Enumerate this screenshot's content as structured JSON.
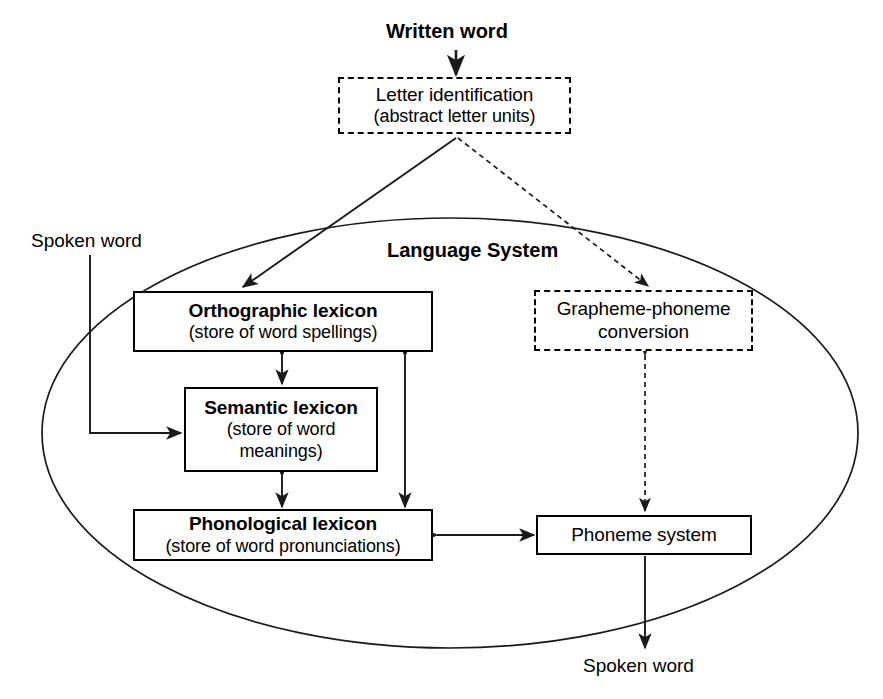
{
  "diagram": {
    "container_label": "Language System",
    "inputs": {
      "written_word": "Written word",
      "spoken_word_input": "Spoken word"
    },
    "outputs": {
      "spoken_word_output": "Spoken word"
    },
    "nodes": [
      {
        "id": "letter-identification",
        "title": "Letter identification",
        "subtitle": "(abstract letter units)",
        "style": "dashed",
        "bold_title": false
      },
      {
        "id": "orthographic-lexicon",
        "title": "Orthographic lexicon",
        "subtitle": "(store of word spellings)",
        "style": "solid",
        "bold_title": true
      },
      {
        "id": "semantic-lexicon",
        "title": "Semantic lexicon",
        "subtitle": "(store of word meanings)",
        "style": "solid",
        "bold_title": true
      },
      {
        "id": "phonological-lexicon",
        "title": "Phonological lexicon",
        "subtitle": "(store of word pronunciations)",
        "style": "solid",
        "bold_title": true
      },
      {
        "id": "grapheme-phoneme-conversion",
        "title": "Grapheme-phoneme conversion",
        "subtitle": "",
        "style": "dashed",
        "bold_title": false
      },
      {
        "id": "phoneme-system",
        "title": "Phoneme system",
        "subtitle": "",
        "style": "solid",
        "bold_title": false
      }
    ],
    "node_text": {
      "letter_identification_l1": "Letter identification",
      "letter_identification_l2": "(abstract letter units)",
      "orthographic_l1": "Orthographic lexicon",
      "orthographic_l2": "(store of word spellings)",
      "semantic_l1": "Semantic lexicon",
      "semantic_l2": "(store of word",
      "semantic_l3": "meanings)",
      "phonological_l1": "Phonological lexicon",
      "phonological_l2": "(store of word pronunciations)",
      "grapheme_l1": "Grapheme-phoneme",
      "grapheme_l2": "conversion",
      "phoneme_l1": "Phoneme system"
    },
    "edges": [
      {
        "id": "written-to-letter",
        "from": "Written word",
        "to": "Letter identification",
        "style": "solid",
        "direction": "one-way"
      },
      {
        "id": "letter-to-orthographic",
        "from": "Letter identification",
        "to": "Orthographic lexicon",
        "style": "solid",
        "direction": "one-way"
      },
      {
        "id": "letter-to-grapheme",
        "from": "Letter identification",
        "to": "Grapheme-phoneme conversion",
        "style": "dashed",
        "direction": "one-way"
      },
      {
        "id": "spoken-in-to-semantic",
        "from": "Spoken word",
        "to": "Semantic lexicon",
        "style": "solid",
        "direction": "one-way"
      },
      {
        "id": "orthographic-to-semantic",
        "from": "Orthographic lexicon",
        "to": "Semantic lexicon",
        "style": "solid",
        "direction": "two-way"
      },
      {
        "id": "semantic-to-phonological",
        "from": "Semantic lexicon",
        "to": "Phonological lexicon",
        "style": "solid",
        "direction": "two-way"
      },
      {
        "id": "orthographic-to-phonological",
        "from": "Orthographic lexicon",
        "to": "Phonological lexicon",
        "style": "solid",
        "direction": "two-way"
      },
      {
        "id": "phonological-to-phoneme",
        "from": "Phonological lexicon",
        "to": "Phoneme system",
        "style": "solid",
        "direction": "two-way"
      },
      {
        "id": "grapheme-to-phoneme",
        "from": "Grapheme-phoneme conversion",
        "to": "Phoneme system",
        "style": "dashed",
        "direction": "two-way"
      },
      {
        "id": "phoneme-to-spoken-out",
        "from": "Phoneme system",
        "to": "Spoken word",
        "style": "solid",
        "direction": "one-way"
      }
    ],
    "colors": {
      "stroke": "#1a1a1a",
      "background": "#ffffff",
      "text": "#000000"
    }
  }
}
